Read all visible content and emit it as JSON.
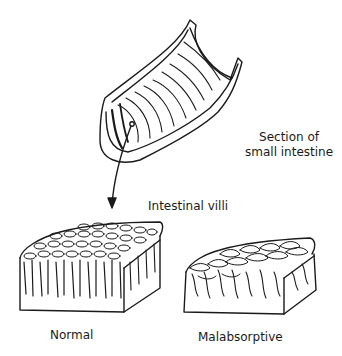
{
  "figure": {
    "labels": {
      "section_line1": "Section of",
      "section_line2": "small intestine",
      "villi": "Intestinal villi",
      "normal": "Normal",
      "malabsorptive": "Malabsorptive"
    },
    "colors": {
      "ink": "#1a1a1a",
      "background": "#ffffff"
    }
  }
}
